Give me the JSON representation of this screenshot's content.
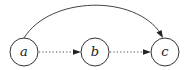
{
  "diagram": {
    "type": "directed-graph",
    "nodes": [
      {
        "id": "a",
        "label": "a",
        "cx": 24,
        "cy": 52,
        "r": 14
      },
      {
        "id": "b",
        "label": "b",
        "cx": 95,
        "cy": 52,
        "r": 14
      },
      {
        "id": "c",
        "label": "c",
        "cx": 165,
        "cy": 52,
        "r": 14
      }
    ],
    "edges": [
      {
        "from": "a",
        "to": "b",
        "style": "dotted"
      },
      {
        "from": "b",
        "to": "c",
        "style": "dotted"
      },
      {
        "from": "a",
        "to": "c",
        "style": "solid-curved"
      }
    ],
    "colors": {
      "stroke": "#333333",
      "background": "#ffffff"
    }
  }
}
